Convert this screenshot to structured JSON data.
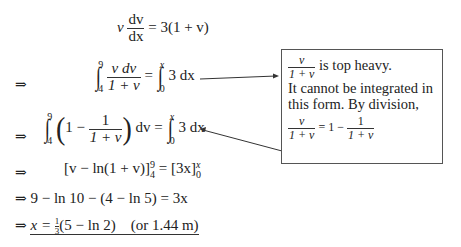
{
  "equations": {
    "line1": {
      "lhs_v": "v",
      "frac_num": "dv",
      "frac_den": "dx",
      "rhs": "= 3(1 + v)"
    },
    "line2": {
      "arrow": "⇒",
      "int_lower": "4",
      "int_upper": "9",
      "frac_num": "v dv",
      "frac_den": "1 + v",
      "equals": "=",
      "int2_lower": "0",
      "int2_upper": "x",
      "rhs": "3 dx"
    },
    "line3": {
      "arrow": "⇒",
      "int_lower": "4",
      "int_upper": "9",
      "open": "(",
      "one_minus": "1 −",
      "frac_num": "1",
      "frac_den": "1 + v",
      "close": ")",
      "dv": "dv =",
      "int2_lower": "0",
      "int2_upper": "x",
      "rhs": "3 dx"
    },
    "line4": {
      "arrow": "⇒",
      "text": "[v − ln(1 + v)]",
      "lower": "4",
      "upper": "9",
      "mid": " = [3x]",
      "lower2": "0",
      "upper2": "x"
    },
    "line5": {
      "arrow": "⇒",
      "text": "9 − ln 10 − (4 − ln 5) = 3x"
    },
    "line6": {
      "arrow": "⇒",
      "lhs": "x = ",
      "frac_num": "1",
      "frac_den": "3",
      "rhs": "(5 − ln 2)",
      "note": "(or 1.44 m)"
    }
  },
  "annotation": {
    "frac_num": "v",
    "frac_den": "1 + v",
    "line1_text": " is top heavy.",
    "line2_text": "It cannot be integrated in",
    "line3_text": "this form. By division,",
    "eq_frac_num": "v",
    "eq_frac_den": "1 + v",
    "eq_mid": " = 1 − ",
    "eq_frac2_num": "1",
    "eq_frac2_den": "1 + v"
  }
}
